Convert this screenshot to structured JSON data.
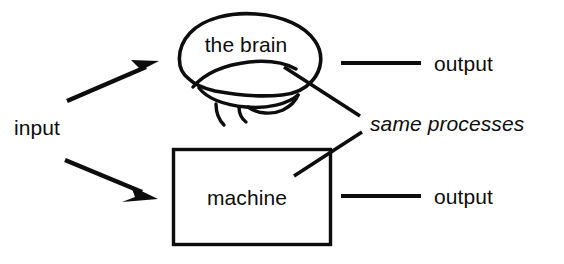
{
  "diagram": {
    "canvas": {
      "width": 564,
      "height": 264,
      "background": "#ffffff"
    },
    "ink_color": "#0d0d0d",
    "nodes": {
      "input_label": "input",
      "brain_label": "the brain",
      "machine_label": "machine",
      "output_top_label": "output",
      "output_bottom_label": "output",
      "annotation_label": "same processes"
    },
    "icons": {
      "brain": "brain-icon",
      "machine": "machine-box-icon",
      "arrow_up": "arrow-up-right-icon",
      "arrow_down": "arrow-down-right-icon"
    },
    "connections": [
      {
        "name": "input-to-brain",
        "from": "input",
        "to": "the brain",
        "style": "arrow"
      },
      {
        "name": "input-to-machine",
        "from": "input",
        "to": "machine",
        "style": "arrow"
      },
      {
        "name": "brain-to-output",
        "from": "the brain",
        "to": "output",
        "style": "line"
      },
      {
        "name": "machine-to-output",
        "from": "machine",
        "to": "output",
        "style": "line"
      },
      {
        "name": "brain-to-annotation",
        "from": "the brain",
        "to": "same processes",
        "style": "leader"
      },
      {
        "name": "machine-to-annotation",
        "from": "machine",
        "to": "same processes",
        "style": "leader"
      }
    ]
  }
}
